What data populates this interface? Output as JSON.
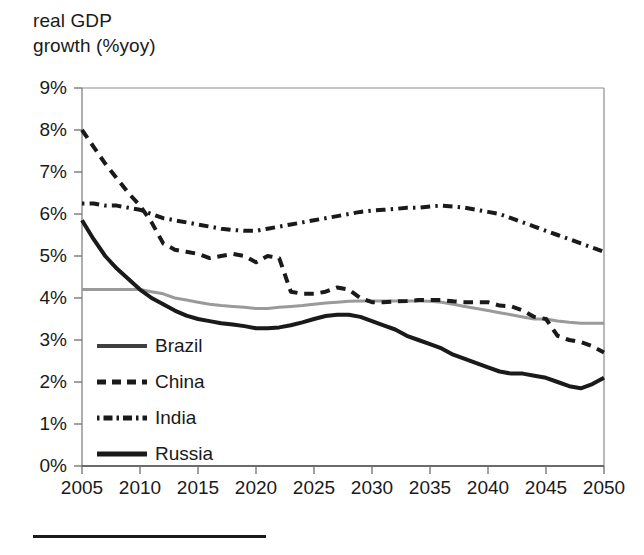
{
  "chart_data": {
    "type": "line",
    "title_line1": "real GDP",
    "title_line2": "growth (%yoy)",
    "xlabel": "",
    "ylabel": "real GDP growth (%yoy)",
    "xlim": [
      2005,
      2050
    ],
    "ylim": [
      0,
      9
    ],
    "grid": false,
    "legend_position": "inside-lower-left",
    "x_tick_labels": [
      "2005",
      "2010",
      "2015",
      "2020",
      "2025",
      "2030",
      "2035",
      "2040",
      "2045",
      "2050"
    ],
    "x_ticks": [
      2005,
      2010,
      2015,
      2020,
      2025,
      2030,
      2035,
      2040,
      2045,
      2050
    ],
    "y_tick_labels": [
      "0%",
      "1%",
      "2%",
      "3%",
      "4%",
      "5%",
      "6%",
      "7%",
      "8%",
      "9%"
    ],
    "y_ticks": [
      0,
      1,
      2,
      3,
      4,
      5,
      6,
      7,
      8,
      9
    ],
    "x": [
      2005,
      2006,
      2007,
      2008,
      2009,
      2010,
      2011,
      2012,
      2013,
      2014,
      2015,
      2016,
      2017,
      2018,
      2019,
      2020,
      2021,
      2022,
      2023,
      2024,
      2025,
      2026,
      2027,
      2028,
      2029,
      2030,
      2031,
      2032,
      2033,
      2034,
      2035,
      2036,
      2037,
      2038,
      2039,
      2040,
      2041,
      2042,
      2043,
      2044,
      2045,
      2046,
      2047,
      2048,
      2049,
      2050
    ],
    "series": [
      {
        "name": "Brazil",
        "color": "#9a9a9a",
        "style": "solid",
        "width": 3,
        "values": [
          4.2,
          4.2,
          4.2,
          4.2,
          4.2,
          4.2,
          4.15,
          4.1,
          4.0,
          3.95,
          3.9,
          3.85,
          3.82,
          3.8,
          3.78,
          3.75,
          3.75,
          3.78,
          3.8,
          3.82,
          3.85,
          3.88,
          3.9,
          3.92,
          3.93,
          3.93,
          3.93,
          3.93,
          3.93,
          3.93,
          3.92,
          3.9,
          3.85,
          3.8,
          3.75,
          3.7,
          3.65,
          3.6,
          3.55,
          3.5,
          3.5,
          3.45,
          3.42,
          3.4,
          3.4,
          3.4
        ]
      },
      {
        "name": "China",
        "color": "#1a1a1a",
        "style": "dashed",
        "width": 4,
        "values": [
          8.0,
          7.6,
          7.2,
          6.85,
          6.5,
          6.2,
          5.8,
          5.3,
          5.15,
          5.1,
          5.05,
          4.95,
          5.0,
          5.05,
          5.0,
          4.85,
          5.0,
          4.95,
          4.15,
          4.1,
          4.1,
          4.15,
          4.25,
          4.2,
          4.0,
          3.9,
          3.9,
          3.92,
          3.93,
          3.95,
          3.95,
          3.95,
          3.92,
          3.9,
          3.9,
          3.9,
          3.82,
          3.8,
          3.7,
          3.55,
          3.5,
          3.1,
          3.0,
          2.95,
          2.85,
          2.7
        ]
      },
      {
        "name": "India",
        "color": "#1a1a1a",
        "style": "dashdot",
        "width": 4,
        "values": [
          6.25,
          6.25,
          6.2,
          6.2,
          6.15,
          6.1,
          6.0,
          5.9,
          5.85,
          5.8,
          5.75,
          5.7,
          5.65,
          5.62,
          5.6,
          5.6,
          5.65,
          5.7,
          5.75,
          5.8,
          5.85,
          5.9,
          5.95,
          6.0,
          6.05,
          6.08,
          6.1,
          6.12,
          6.15,
          6.15,
          6.18,
          6.2,
          6.18,
          6.15,
          6.1,
          6.05,
          6.0,
          5.9,
          5.8,
          5.7,
          5.6,
          5.5,
          5.4,
          5.3,
          5.2,
          5.1
        ]
      },
      {
        "name": "Russia",
        "color": "#1a1a1a",
        "style": "solid",
        "width": 4,
        "values": [
          5.85,
          5.4,
          5.0,
          4.7,
          4.45,
          4.2,
          4.0,
          3.85,
          3.7,
          3.58,
          3.5,
          3.45,
          3.4,
          3.37,
          3.33,
          3.28,
          3.28,
          3.3,
          3.35,
          3.42,
          3.5,
          3.57,
          3.6,
          3.6,
          3.55,
          3.45,
          3.35,
          3.25,
          3.1,
          3.0,
          2.9,
          2.8,
          2.65,
          2.55,
          2.45,
          2.35,
          2.25,
          2.2,
          2.2,
          2.15,
          2.1,
          2.0,
          1.9,
          1.85,
          1.95,
          2.1
        ]
      }
    ]
  },
  "legend": {
    "items": [
      {
        "label": "Brazil"
      },
      {
        "label": "China"
      },
      {
        "label": "India"
      },
      {
        "label": "Russia"
      }
    ]
  },
  "colors": {
    "axis": "#8c8c8c",
    "text": "#1a1a1a",
    "brazil": "#9a9a9a",
    "china": "#1a1a1a",
    "india": "#1a1a1a",
    "russia": "#1a1a1a"
  }
}
